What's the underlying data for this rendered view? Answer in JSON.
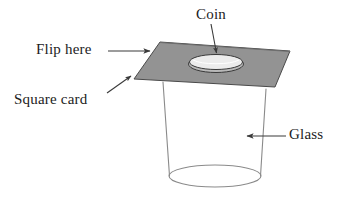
{
  "figure": {
    "width": 340,
    "height": 206,
    "background_color": "#ffffff"
  },
  "labels": {
    "coin": "Coin",
    "flip_here": "Flip here",
    "square_card": "Square card",
    "glass": "Glass"
  },
  "colors": {
    "card_fill": "#939393",
    "card_stroke": "#4a4a4a",
    "coin_fill": "#e9e9e9",
    "coin_rim_fill": "#c9c9c9",
    "coin_stroke": "#3a3a3a",
    "glass_stroke": "#8a8a8a",
    "glass_fill": "#ffffff",
    "text": "#1c1c1c",
    "leader_line": "#4a4a4a"
  },
  "geometry": {
    "card_polygon": "160,42 290,51 275,87 134,79",
    "coin_center": [
      216,
      62
    ],
    "coin_rx": 27,
    "coin_ry": 8,
    "glass_top_left": [
      163,
      82
    ],
    "glass_top_right": [
      266,
      89
    ],
    "glass_bottom_center": [
      215,
      181
    ],
    "glass_bottom_rx": 46,
    "glass_bottom_ry": 11
  },
  "annotations": [
    {
      "name": "coin-leader",
      "from": [
        212,
        24
      ],
      "to": [
        216,
        54
      ]
    },
    {
      "name": "flip-here-arrow",
      "from": [
        111,
        50
      ],
      "to": [
        152,
        50
      ]
    },
    {
      "name": "square-card-leader",
      "from": [
        108,
        92
      ],
      "to": [
        133,
        74
      ]
    },
    {
      "name": "glass-arrow",
      "from": [
        285,
        136
      ],
      "to": [
        246,
        136
      ]
    }
  ]
}
